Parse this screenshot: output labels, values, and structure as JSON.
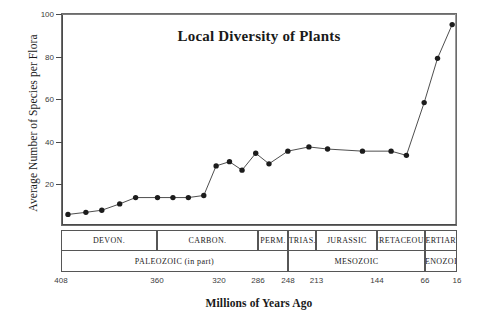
{
  "chart_data": {
    "type": "line",
    "title": "Local Diversity of Plants",
    "xlabel": "Millions of Years Ago",
    "ylabel": "Average Number of Species per Flora",
    "ylim": [
      0,
      100
    ],
    "yticks": [
      0,
      20,
      40,
      60,
      80,
      100
    ],
    "ytick_labels": [
      "",
      "20",
      "40",
      "60",
      "80",
      "100"
    ],
    "xlim": [
      408,
      16
    ],
    "x_axis_direction": "decreasing",
    "xticks": [
      408,
      360,
      320,
      286,
      248,
      213,
      144,
      66,
      16
    ],
    "xtick_labels": [
      "408",
      "360",
      "320",
      "286",
      "248",
      "213",
      "144",
      "66",
      "16"
    ],
    "grid": false,
    "legend": "none",
    "marker": "filled-circle",
    "series": [
      {
        "name": "Average number of species per flora",
        "x": [
          405,
          396,
          388,
          379,
          371,
          363,
          352,
          342,
          330,
          322,
          311,
          300,
          288,
          272,
          248,
          222,
          200,
          175,
          148,
          120,
          90,
          66,
          40,
          18
        ],
        "y": [
          5,
          6,
          7,
          10,
          13,
          13,
          13,
          13,
          14,
          28,
          30,
          26,
          34,
          29,
          35,
          37,
          36,
          35,
          35,
          33,
          58,
          79,
          95,
          95
        ]
      }
    ],
    "points": [
      {
        "x": 405,
        "y": 5
      },
      {
        "x": 396,
        "y": 6
      },
      {
        "x": 388,
        "y": 7
      },
      {
        "x": 379,
        "y": 10
      },
      {
        "x": 371,
        "y": 13
      },
      {
        "x": 360,
        "y": 13
      },
      {
        "x": 350,
        "y": 13
      },
      {
        "x": 340,
        "y": 13
      },
      {
        "x": 330,
        "y": 14
      },
      {
        "x": 322,
        "y": 28
      },
      {
        "x": 311,
        "y": 30
      },
      {
        "x": 300,
        "y": 26
      },
      {
        "x": 288,
        "y": 34
      },
      {
        "x": 272,
        "y": 29
      },
      {
        "x": 248,
        "y": 35
      },
      {
        "x": 222,
        "y": 37
      },
      {
        "x": 200,
        "y": 36
      },
      {
        "x": 160,
        "y": 35
      },
      {
        "x": 120,
        "y": 35
      },
      {
        "x": 95,
        "y": 33
      },
      {
        "x": 66,
        "y": 58
      },
      {
        "x": 45,
        "y": 79
      },
      {
        "x": 22,
        "y": 95
      }
    ],
    "periods": [
      {
        "label": "DEVON.",
        "start": 408,
        "end": 360
      },
      {
        "label": "CARBON.",
        "start": 360,
        "end": 286
      },
      {
        "label": "PERM.",
        "start": 286,
        "end": 248
      },
      {
        "label": "TRIAS.",
        "start": 248,
        "end": 213
      },
      {
        "label": "JURASSIC",
        "start": 213,
        "end": 144
      },
      {
        "label": "CRETACEOUS",
        "start": 144,
        "end": 66
      },
      {
        "label": "TERTIARY",
        "start": 66,
        "end": 16
      }
    ],
    "eras": [
      {
        "label": "PALEOZOIC (in part)",
        "start": 408,
        "end": 248
      },
      {
        "label": "MESOZOIC",
        "start": 248,
        "end": 66
      },
      {
        "label": "CENOZOIC",
        "start": 66,
        "end": 16
      }
    ],
    "colors": {
      "line": "#3a3a3a",
      "marker": "#1c1c1c",
      "frame": "#6b6b6b",
      "text": "#1a1a1a",
      "background": "#ffffff"
    }
  }
}
